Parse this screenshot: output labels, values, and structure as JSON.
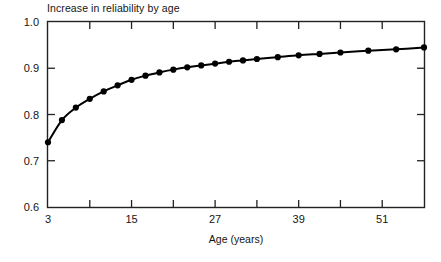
{
  "chart_data": {
    "type": "line",
    "title": "Increase in reliability by age",
    "xlabel": "Age (years)",
    "ylabel": "",
    "xlim": [
      3,
      57
    ],
    "ylim": [
      0.6,
      1.0
    ],
    "grid": false,
    "legend": null,
    "marker": "filled-circle",
    "line_color": "#000000",
    "marker_color": "#000000",
    "background_color": "#ffffff",
    "x_tick_labels": [
      "3",
      "15",
      "27",
      "39",
      "51"
    ],
    "x_tick_values": [
      3,
      15,
      27,
      39,
      51
    ],
    "x_minor_tick_values": [
      9,
      21,
      33,
      45,
      57
    ],
    "y_tick_labels": [
      "0.6",
      "0.7",
      "0.8",
      "0.9",
      "1.0"
    ],
    "y_tick_values": [
      0.6,
      0.7,
      0.8,
      0.9,
      1.0
    ],
    "x": [
      3,
      5,
      7,
      9,
      11,
      13,
      15,
      17,
      19,
      21,
      23,
      25,
      27,
      29,
      31,
      33,
      36,
      39,
      42,
      45,
      49,
      53,
      57
    ],
    "values": [
      0.74,
      0.788,
      0.815,
      0.834,
      0.85,
      0.863,
      0.875,
      0.884,
      0.891,
      0.897,
      0.902,
      0.906,
      0.91,
      0.914,
      0.917,
      0.92,
      0.924,
      0.928,
      0.931,
      0.934,
      0.938,
      0.941,
      0.945
    ],
    "series": [
      {
        "name": "Reliability",
        "x": [
          3,
          5,
          7,
          9,
          11,
          13,
          15,
          17,
          19,
          21,
          23,
          25,
          27,
          29,
          31,
          33,
          36,
          39,
          42,
          45,
          49,
          53,
          57
        ],
        "values": [
          0.74,
          0.788,
          0.815,
          0.834,
          0.85,
          0.863,
          0.875,
          0.884,
          0.891,
          0.897,
          0.902,
          0.906,
          0.91,
          0.914,
          0.917,
          0.92,
          0.924,
          0.928,
          0.931,
          0.934,
          0.938,
          0.941,
          0.945
        ]
      }
    ]
  }
}
